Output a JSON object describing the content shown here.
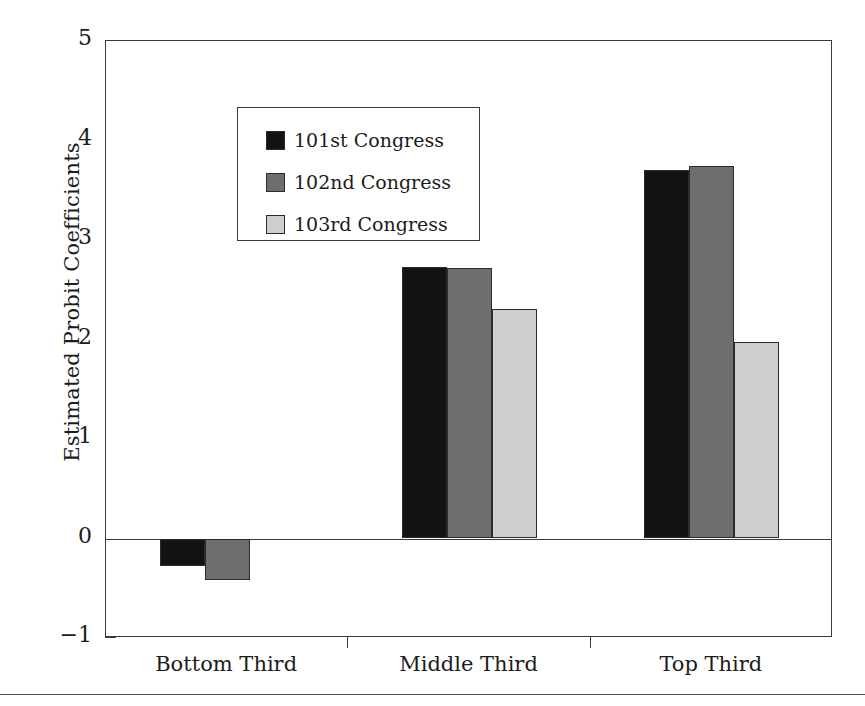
{
  "chart_data": {
    "type": "bar",
    "title": "",
    "xlabel": "",
    "ylabel": "Estimated Probit Coefficients",
    "categories": [
      "Bottom Third",
      "Middle Third",
      "Top Third"
    ],
    "series": [
      {
        "name": "101st Congress",
        "color": "#131313",
        "values": [
          -0.28,
          2.73,
          3.7
        ]
      },
      {
        "name": "102nd Congress",
        "color": "#6e6e6e",
        "values": [
          -0.42,
          2.72,
          3.74
        ]
      },
      {
        "name": "103rd Congress",
        "color": "#cecece",
        "values": [
          0.0,
          2.31,
          1.97
        ]
      }
    ],
    "ylim": [
      -1,
      5
    ],
    "yticks": [
      5,
      4,
      3,
      2,
      1,
      0,
      -1
    ],
    "ytick_labels": [
      "5",
      "4",
      "3",
      "2",
      "1",
      "0",
      "−1"
    ],
    "grid": false,
    "legend_position": "upper-left",
    "zero_line": true
  },
  "legend": {
    "items": [
      {
        "label": "101st Congress",
        "swatch": "series-0-swatch"
      },
      {
        "label": "102nd Congress",
        "swatch": "series-1-swatch"
      },
      {
        "label": "103rd Congress",
        "swatch": "series-2-swatch"
      }
    ]
  }
}
